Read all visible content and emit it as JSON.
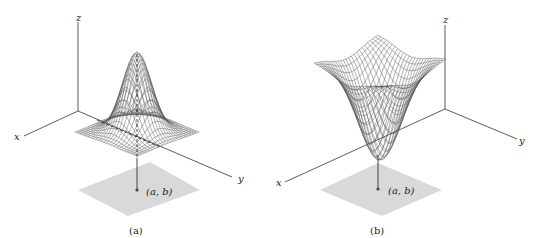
{
  "figures": [
    {
      "id": "a",
      "caption": "(a)",
      "surface": "local maximum (peak)",
      "axis_labels": {
        "x": "x",
        "y": "y",
        "z": "z"
      },
      "point_label": "(a, b)"
    },
    {
      "id": "b",
      "caption": "(b)",
      "surface": "local minimum (well)",
      "axis_labels": {
        "x": "x",
        "y": "y",
        "z": "z"
      },
      "point_label": "(a, b)"
    }
  ],
  "colors": {
    "axis": "#333333",
    "mesh": "#555555",
    "plane": "#d9d9d9",
    "point": "#444444"
  }
}
